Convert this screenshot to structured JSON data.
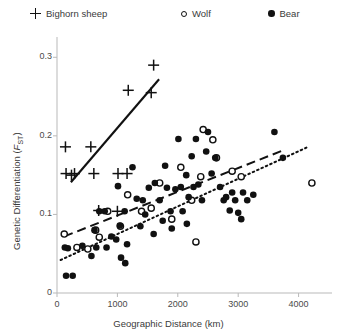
{
  "legend": {
    "items": [
      {
        "label": "Bighorn sheep",
        "marker": "plus-marker-icon"
      },
      {
        "label": "Wolf",
        "marker": "open-circle-marker-icon"
      },
      {
        "label": "Bear",
        "marker": "filled-circle-marker-icon"
      }
    ]
  },
  "axes": {
    "xlabel": "Geographic Distance (km)",
    "ylabel_main": "Genetic Differentiation (",
    "ylabel_sub": "F",
    "ylabel_sub2": "ST",
    "ylabel_close": ")",
    "xticks": [
      "0",
      "1000",
      "2000",
      "3000",
      "4000"
    ],
    "yticks": [
      "0",
      "0.1",
      "0.2",
      "0.3"
    ]
  },
  "chart_data": {
    "type": "scatter",
    "title": "",
    "xlabel": "Geographic Distance (km)",
    "ylabel": "Genetic Differentiation (FST)",
    "xlim": [
      0,
      4520
    ],
    "ylim": [
      0,
      0.322
    ],
    "xticks": [
      0,
      1000,
      2000,
      3000,
      4000
    ],
    "yticks": [
      0,
      0.1,
      0.2,
      0.3
    ],
    "grid": false,
    "legend_position": "top",
    "series": [
      {
        "name": "Bighorn sheep",
        "marker": "plus",
        "color": "#111111",
        "points": [
          [
            140,
            0.186
          ],
          [
            150,
            0.152
          ],
          [
            240,
            0.15
          ],
          [
            290,
            0.152
          ],
          [
            560,
            0.186
          ],
          [
            610,
            0.152
          ],
          [
            1010,
            0.152
          ],
          [
            1160,
            0.152
          ],
          [
            1180,
            0.258
          ],
          [
            1600,
            0.29
          ],
          [
            1560,
            0.255
          ],
          [
            690,
            0.105
          ],
          [
            1000,
            0.104
          ]
        ],
        "trendline": {
          "style": "solid",
          "x1": 230,
          "y1": 0.141,
          "x2": 1690,
          "y2": 0.272
        }
      },
      {
        "name": "Wolf",
        "marker": "open-circle",
        "color": "#111111",
        "points": [
          [
            120,
            0.075
          ],
          [
            330,
            0.058
          ],
          [
            510,
            0.056
          ],
          [
            640,
            0.08
          ],
          [
            700,
            0.071
          ],
          [
            840,
            0.104
          ],
          [
            1050,
            0.085
          ],
          [
            1170,
            0.125
          ],
          [
            1400,
            0.104
          ],
          [
            1560,
            0.108
          ],
          [
            1700,
            0.14
          ],
          [
            1900,
            0.094
          ],
          [
            2050,
            0.16
          ],
          [
            2230,
            0.118
          ],
          [
            2380,
            0.148
          ],
          [
            2420,
            0.208
          ],
          [
            2580,
            0.195
          ],
          [
            2640,
            0.172
          ],
          [
            2300,
            0.065
          ],
          [
            2900,
            0.155
          ],
          [
            3050,
            0.148
          ],
          [
            4220,
            0.14
          ]
        ],
        "trendline": {
          "style": "dashed",
          "x1": 120,
          "y1": 0.072,
          "x2": 3760,
          "y2": 0.182
        }
      },
      {
        "name": "Bear",
        "marker": "filled-circle",
        "color": "#111111",
        "points": [
          [
            130,
            0.058
          ],
          [
            180,
            0.057
          ],
          [
            150,
            0.022
          ],
          [
            260,
            0.022
          ],
          [
            420,
            0.06
          ],
          [
            570,
            0.047
          ],
          [
            620,
            0.08
          ],
          [
            650,
            0.058
          ],
          [
            700,
            0.104
          ],
          [
            790,
            0.104
          ],
          [
            820,
            0.058
          ],
          [
            900,
            0.072
          ],
          [
            980,
            0.068
          ],
          [
            1010,
            0.136
          ],
          [
            1040,
            0.086
          ],
          [
            1060,
            0.045
          ],
          [
            1120,
            0.104
          ],
          [
            1130,
            0.038
          ],
          [
            1160,
            0.062
          ],
          [
            1250,
            0.16
          ],
          [
            1320,
            0.12
          ],
          [
            1380,
            0.085
          ],
          [
            1420,
            0.118
          ],
          [
            1460,
            0.1
          ],
          [
            1520,
            0.134
          ],
          [
            1600,
            0.075
          ],
          [
            1620,
            0.14
          ],
          [
            1700,
            0.118
          ],
          [
            1750,
            0.092
          ],
          [
            1790,
            0.162
          ],
          [
            1820,
            0.134
          ],
          [
            1880,
            0.104
          ],
          [
            1900,
            0.082
          ],
          [
            1960,
            0.132
          ],
          [
            2010,
            0.196
          ],
          [
            2050,
            0.135
          ],
          [
            2080,
            0.104
          ],
          [
            2140,
            0.15
          ],
          [
            2180,
            0.122
          ],
          [
            2230,
            0.174
          ],
          [
            2260,
            0.135
          ],
          [
            2300,
            0.196
          ],
          [
            2340,
            0.138
          ],
          [
            2400,
            0.118
          ],
          [
            2470,
            0.18
          ],
          [
            2500,
            0.205
          ],
          [
            2560,
            0.152
          ],
          [
            2620,
            0.172
          ],
          [
            2700,
            0.135
          ],
          [
            2760,
            0.118
          ],
          [
            2800,
            0.122
          ],
          [
            2860,
            0.105
          ],
          [
            2900,
            0.128
          ],
          [
            2950,
            0.118
          ],
          [
            3000,
            0.102
          ],
          [
            3080,
            0.128
          ],
          [
            3150,
            0.118
          ],
          [
            3250,
            0.125
          ],
          [
            3600,
            0.205
          ],
          [
            3740,
            0.172
          ],
          [
            3050,
            0.094
          ],
          [
            2150,
            0.088
          ]
        ],
        "trendline": {
          "style": "dotted",
          "x1": 60,
          "y1": 0.042,
          "x2": 4130,
          "y2": 0.185
        }
      }
    ]
  }
}
